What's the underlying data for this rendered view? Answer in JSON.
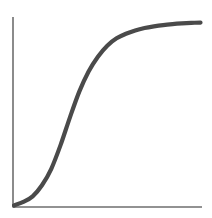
{
  "chart_data": {
    "type": "line",
    "title": "",
    "subtitle": "",
    "xlabel": "",
    "ylabel": "",
    "grid": false,
    "legend": false,
    "legend_position": "none",
    "xlim": [
      0,
      10
    ],
    "ylim": [
      0,
      1
    ],
    "xticks": [],
    "yticks": [],
    "xticklabels": [],
    "yticklabels": [],
    "annotations": [],
    "series": [
      {
        "name": "sigmoid-curve",
        "color": "#4a4a4a",
        "linewidth": 4.2,
        "x": [
          0.0,
          0.5,
          1.0,
          1.5,
          2.0,
          2.5,
          3.0,
          3.5,
          4.0,
          4.5,
          5.0,
          5.5,
          6.0,
          6.5,
          7.0,
          7.5,
          8.0,
          8.5,
          9.0,
          9.5,
          10.0
        ],
        "values": [
          0.0,
          0.02,
          0.05,
          0.11,
          0.2,
          0.33,
          0.48,
          0.62,
          0.73,
          0.81,
          0.87,
          0.91,
          0.935,
          0.953,
          0.966,
          0.975,
          0.982,
          0.987,
          0.991,
          0.994,
          0.996
        ]
      }
    ],
    "axes": {
      "x_axis_color": "#6e6e6e",
      "y_axis_color": "#6e6e6e",
      "spines": [
        "left",
        "bottom"
      ],
      "origin_px": [
        13,
        207
      ],
      "x_axis_end_px": [
        202,
        207
      ],
      "y_axis_top_px": [
        13,
        17
      ]
    },
    "background_color": "#ffffff"
  }
}
